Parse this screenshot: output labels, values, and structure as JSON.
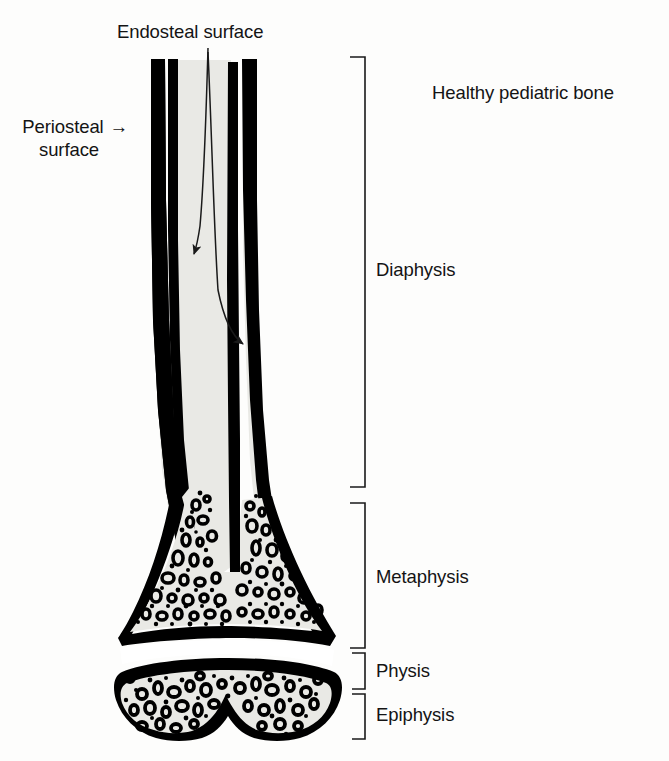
{
  "figure": {
    "title": "Healthy pediatric bone",
    "type": "anatomical-line-diagram",
    "background_color": "#fdfdfc"
  },
  "colors": {
    "cortex": "#000000",
    "marrow": "#e9e9e5",
    "trabecular_fill": "#e9e9e5",
    "trabecula": "#000000",
    "text": "#141414",
    "bracket": "#1a1a1a",
    "leader": "#1a1a1a"
  },
  "callouts": {
    "endosteal": {
      "label": "Endosteal surface",
      "arrow_count": 2
    },
    "periosteal": {
      "line_1": "Periosteal",
      "line_2": "surface",
      "arrow_glyph": "→"
    }
  },
  "brackets": [
    {
      "key": "diaphysis",
      "label": "Diaphysis",
      "top": 57,
      "bottom": 487
    },
    {
      "key": "metaphysis",
      "label": "Metaphysis",
      "top": 503,
      "bottom": 648
    },
    {
      "key": "physis",
      "label": "Physis",
      "top": 653,
      "bottom": 689
    },
    {
      "key": "epiphysis",
      "label": "Epiphysis",
      "top": 694,
      "bottom": 739
    }
  ],
  "regions": {
    "healthy_bone": "Healthy pediatric bone",
    "diaphysis": "Diaphysis",
    "metaphysis": "Metaphysis",
    "physis": "Physis",
    "epiphysis": "Epiphysis"
  }
}
